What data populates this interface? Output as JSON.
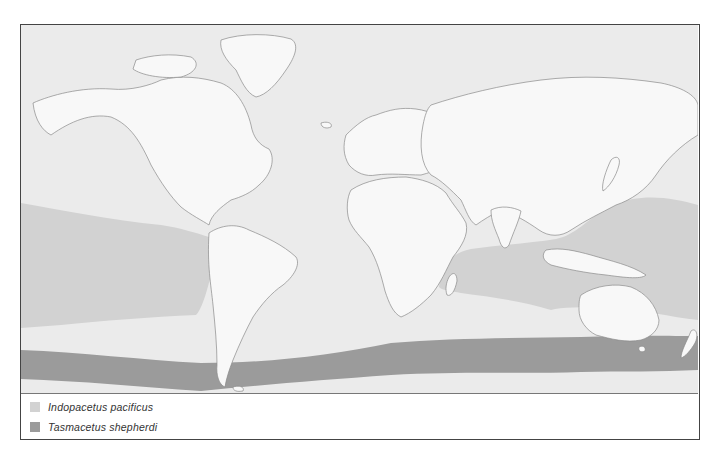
{
  "map": {
    "colors": {
      "ocean": "#ebebeb",
      "land": "#f8f8f8",
      "coastline": "#8a8a8a",
      "indopacetus_range": "#d2d2d2",
      "tasmacetus_range": "#9b9b9b"
    }
  },
  "legend": {
    "items": [
      {
        "label": "Indopacetus pacificus",
        "color": "#d2d2d2"
      },
      {
        "label": "Tasmacetus shepherdi",
        "color": "#9b9b9b"
      }
    ]
  }
}
